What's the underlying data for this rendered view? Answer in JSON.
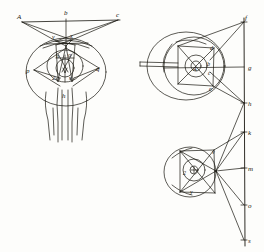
{
  "plate": {
    "title": "Ocular anatomy and refraction plate",
    "background_color": "#fdfdfb",
    "ink_color": "#17150f",
    "figure_count": 3
  },
  "figures": [
    {
      "id": "figure-left",
      "name": "anterior-view-eyes-with-optic-nerves",
      "description": "Frontal view of two eyeballs joined at the optic chiasm with converging rays from three external points",
      "labels": [
        {
          "id": "a",
          "text": "A",
          "x": 17,
          "y": 19,
          "role": "external-object-point-left"
        },
        {
          "id": "b",
          "text": "b",
          "x": 66,
          "y": 15,
          "role": "external-object-point-center"
        },
        {
          "id": "c",
          "text": "c",
          "x": 118,
          "y": 17,
          "role": "external-object-point-right"
        },
        {
          "id": "v",
          "text": "v",
          "x": 54,
          "y": 37,
          "role": "corneal-point-left"
        },
        {
          "id": "x",
          "text": "x",
          "x": 71,
          "y": 36,
          "role": "corneal-point-right"
        },
        {
          "id": "n",
          "text": "n",
          "x": 57,
          "y": 56,
          "role": "lens-edge-left"
        },
        {
          "id": "o",
          "text": "o",
          "x": 69,
          "y": 55,
          "role": "lens-edge-right"
        },
        {
          "id": "p",
          "text": "p",
          "x": 28,
          "y": 71,
          "role": "lateral-point-left"
        },
        {
          "id": "q",
          "text": "q",
          "x": 97,
          "y": 69,
          "role": "lateral-point-right"
        },
        {
          "id": "2",
          "text": "2",
          "x": 54,
          "y": 76,
          "role": "retina-image-left"
        },
        {
          "id": "s",
          "text": "s",
          "x": 70,
          "y": 76,
          "role": "retina-image-right"
        },
        {
          "id": "h",
          "text": "h",
          "x": 64,
          "y": 94,
          "role": "optic-chiasm"
        }
      ]
    },
    {
      "id": "figure-upper-right",
      "name": "sectional-eye-with-ciliary-body",
      "description": "Horizontal section of an eye showing cornea, lens and optic nerve with rays to a vertical screen",
      "labels": [
        {
          "id": "a2",
          "text": "A",
          "x": 196,
          "y": 68,
          "role": "lens-center"
        },
        {
          "id": "d",
          "text": "d",
          "x": 211,
          "y": 49,
          "role": "upper-lens-margin"
        },
        {
          "id": "b2",
          "text": "b",
          "x": 208,
          "y": 64,
          "role": "nodal-point"
        },
        {
          "id": "c2",
          "text": "c",
          "x": 209,
          "y": 72,
          "role": "lower-refraction-point"
        },
        {
          "id": "e",
          "text": "e",
          "x": 210,
          "y": 88,
          "role": "lower-eye-margin"
        }
      ]
    },
    {
      "id": "figure-lower-right",
      "name": "sectional-eye-with-ray-fan",
      "description": "Section of an eye emitting a fan of rays toward a vertical screen",
      "labels": [
        {
          "id": "2b",
          "text": "2",
          "x": 186,
          "y": 171,
          "role": "retina-point"
        },
        {
          "id": "v2",
          "text": "v",
          "x": 214,
          "y": 152,
          "role": "upper-cornea-point"
        },
        {
          "id": "y",
          "text": "y",
          "x": 192,
          "y": 190,
          "role": "lower-cornea-point"
        }
      ]
    },
    {
      "id": "figure-screen",
      "name": "vertical-projection-screen",
      "description": "Vertical line at right marked with lettered intersection points",
      "labels": [
        {
          "id": "f",
          "text": "f",
          "x": 246,
          "y": 19,
          "role": "screen-point-f"
        },
        {
          "id": "g",
          "text": "g",
          "x": 247,
          "y": 67,
          "role": "screen-point-g"
        },
        {
          "id": "h2",
          "text": "h",
          "x": 247,
          "y": 103,
          "role": "screen-point-h"
        },
        {
          "id": "k",
          "text": "k",
          "x": 246,
          "y": 132,
          "role": "screen-point-k"
        },
        {
          "id": "m",
          "text": "m",
          "x": 246,
          "y": 168,
          "role": "screen-point-m"
        },
        {
          "id": "o2",
          "text": "o",
          "x": 245,
          "y": 205,
          "role": "screen-point-o"
        },
        {
          "id": "s2",
          "text": "s",
          "x": 245,
          "y": 239,
          "role": "screen-point-s"
        }
      ]
    }
  ]
}
